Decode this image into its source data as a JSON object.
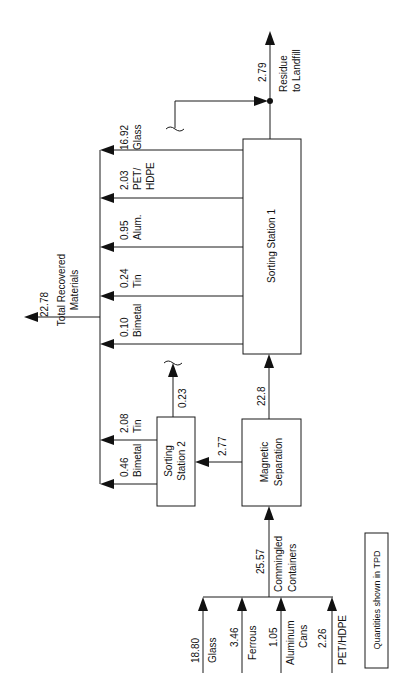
{
  "diagram": {
    "orientation": "rotated-90-ccw",
    "note": "Quantities shown in TPD",
    "nodes": {
      "sorting_station_1": "Sorting Station 1",
      "sorting_station_2_line1": "Sorting",
      "sorting_station_2_line2": "Station 2",
      "magnetic_line1": "Magnetic",
      "magnetic_line2": "Separation"
    },
    "inputs": [
      {
        "value": "18.80",
        "label": "Glass",
        "label2": ""
      },
      {
        "value": "3.46",
        "label": "Ferrous",
        "label2": ""
      },
      {
        "value": "1.05",
        "label": "Aluminum",
        "label2": "Cans"
      },
      {
        "value": "2.26",
        "label": "PET/HDPE",
        "label2": ""
      }
    ],
    "commingled": {
      "value": "25.57",
      "label": "Commingled",
      "label2": "Containers"
    },
    "flows": {
      "mag_to_ss1": "22.8",
      "mag_to_ss2": "2.77",
      "ss2_residue": "0.23"
    },
    "ss2_outputs": [
      {
        "value": "2.08",
        "label": "Tin"
      },
      {
        "value": "0.46",
        "label": "Bimetal"
      }
    ],
    "ss1_outputs": [
      {
        "value": "16.92",
        "label": "Glass",
        "label2": ""
      },
      {
        "value": "2.03",
        "label": "PET/",
        "label2": "HDPE"
      },
      {
        "value": "0.95",
        "label": "Alum.",
        "label2": ""
      },
      {
        "value": "0.24",
        "label": "Tin",
        "label2": ""
      },
      {
        "value": "0.10",
        "label": "Bimetal",
        "label2": ""
      }
    ],
    "total": {
      "value": "22.78",
      "label": "Total Recovered",
      "label2": "Materials"
    },
    "residue": {
      "value": "2.79",
      "label": "Residue",
      "label2": "to Landfill"
    }
  }
}
